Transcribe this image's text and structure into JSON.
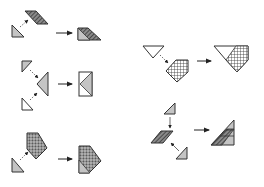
{
  "diagram": {
    "title": "",
    "colors": {
      "background": "#ffffff",
      "stroke": "#333333",
      "gray_fill": "#c4c4c4",
      "white_fill": "#ffffff",
      "dark_hatch": "#5a5a5a",
      "dot_fill": "#9a9a9a",
      "arrow": "#222222"
    },
    "groups": [
      {
        "id": "g1",
        "description": "triangle + hatched parallelogram combine into trapezoid",
        "pieces": [
          "gray-triangle",
          "hatched-parallelogram"
        ],
        "result": "trapezoid"
      },
      {
        "id": "g2",
        "description": "two small triangles + left-pointing triangle combine into rectangle",
        "pieces": [
          "gray-triangle-top",
          "gray-triangle-left",
          "white-triangle-bottom"
        ],
        "result": "rectangle"
      },
      {
        "id": "g3",
        "description": "triangle + dotted pentagon combine into larger pentagon",
        "pieces": [
          "gray-triangle",
          "dotted-pentagon"
        ],
        "result": "pentagon"
      },
      {
        "id": "g4",
        "description": "white inverted triangle + crosshatched pentagon combine into inverted pentagon",
        "pieces": [
          "white-triangle",
          "crosshatched-pentagon"
        ],
        "result": "pentagon"
      },
      {
        "id": "g5",
        "description": "two triangles + hatched parallelogram combine into large triangle",
        "pieces": [
          "gray-triangle-top",
          "hatched-parallelogram",
          "gray-triangle-bottom"
        ],
        "result": "triangle"
      }
    ]
  }
}
